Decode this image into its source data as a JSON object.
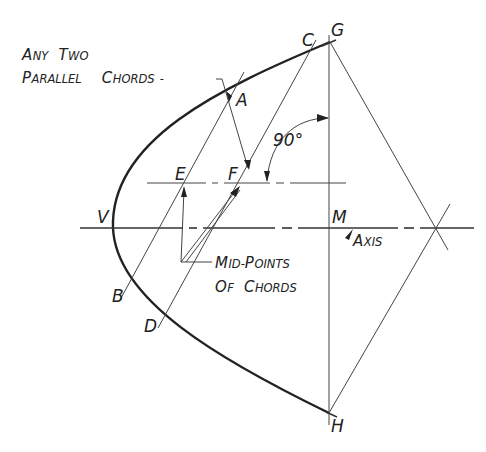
{
  "diagram": {
    "title_line1": {
      "first": "A",
      "rest1": "NY",
      "space": " ",
      "first2": "T",
      "rest2": "WO"
    },
    "title_line2": {
      "first": "P",
      "rest1": "ARALLEL",
      "first2": "C",
      "rest2": "HORDS",
      "dash": "-"
    },
    "point_labels": {
      "A": "A",
      "B": "B",
      "C": "C",
      "D": "D",
      "E": "E",
      "F": "F",
      "G": "G",
      "H": "H",
      "M": "M",
      "V": "V"
    },
    "angle_label": "90°",
    "axis_label": {
      "first": "A",
      "rest": "XIS",
      "symbol": "⌐"
    },
    "midpoints_label_line1": {
      "first": "M",
      "rest1": "ID-",
      "first2": "P",
      "rest2": "OINTS"
    },
    "midpoints_label_line2": {
      "first": "O",
      "rest1": "F",
      "first2": "C",
      "rest2": "HORDS"
    },
    "colors": {
      "ink": "#222222",
      "background": "#ffffff"
    }
  }
}
